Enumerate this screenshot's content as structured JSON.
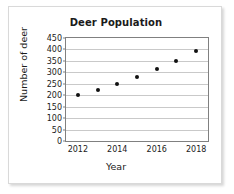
{
  "chart_data": {
    "type": "scatter",
    "title": "Deer Population",
    "xlabel": "Year",
    "ylabel": "Number of deer",
    "x": [
      2012,
      2013,
      2014,
      2015,
      2016,
      2017,
      2018
    ],
    "values": [
      200,
      225,
      250,
      280,
      315,
      350,
      395
    ],
    "series": [
      {
        "name": "Deer Population",
        "values": [
          200,
          225,
          250,
          280,
          315,
          350,
          395
        ]
      }
    ],
    "xlim": [
      2011.4,
      2018.6
    ],
    "ylim": [
      0,
      450
    ],
    "ytick_labels": [
      "0",
      "50",
      "100",
      "150",
      "200",
      "250",
      "300",
      "350",
      "400",
      "450"
    ],
    "ytick_values": [
      0,
      50,
      100,
      150,
      200,
      250,
      300,
      350,
      400,
      450
    ],
    "xtick_labels": [
      "2012",
      "2014",
      "2016",
      "2018"
    ],
    "xtick_values": [
      2012,
      2014,
      2016,
      2018
    ],
    "grid": "horizontal",
    "legend": "none",
    "marker_color": "#111111",
    "gridline_color": "#c9c9c9",
    "axis_color": "#808080"
  }
}
